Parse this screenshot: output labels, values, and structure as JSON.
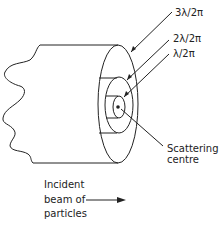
{
  "figure": {
    "labels": {
      "radius_3": "3λ/2π",
      "radius_2": "2λ/2π",
      "radius_1": "λ/2π",
      "scattering_line1": "Scattering",
      "scattering_line2": "centre",
      "beam_line1": "Incident",
      "beam_line2": "beam of",
      "beam_line3": "particles"
    },
    "colors": {
      "stroke": "#222222",
      "background": "#ffffff"
    }
  }
}
